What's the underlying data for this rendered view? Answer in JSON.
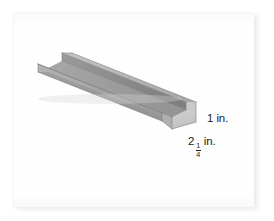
{
  "figure": {
    "background_color": "#ffffff",
    "card_color": "#fefefe",
    "card_shadow_color": "#e4e4e6"
  },
  "labels": {
    "height": {
      "text": "1 in.",
      "value": "1",
      "unit": "in."
    },
    "width": {
      "whole": "2",
      "numerator": "1",
      "denominator": "4",
      "unit": "in.",
      "text": "2 1/4 in."
    }
  },
  "colors": {
    "face_top_flange": "#b9b9b9",
    "face_outer_side": "#a3a3a3",
    "face_inner_wall": "#8e8e8e",
    "face_floor": "#9d9d9d",
    "face_end_cap": "#cfcfcf",
    "face_near_outer": "#bdbdbd",
    "edge_line": "#7c7c7c",
    "label_text": "#1b1b1b"
  }
}
